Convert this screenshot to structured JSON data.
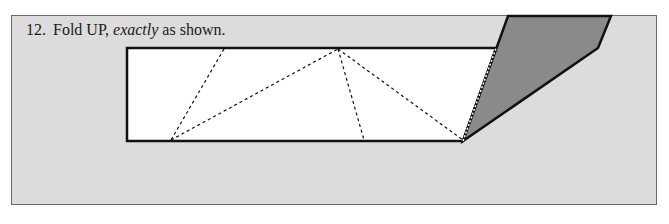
{
  "step": {
    "number": "12.",
    "text_before": "Fold UP, ",
    "text_emphasis": "exactly",
    "text_after": " as shown."
  },
  "colors": {
    "panel_bg": "#dcdcdc",
    "paper": "#ffffff",
    "folded_flap": "#8a8a8a",
    "lines": "#111111"
  }
}
